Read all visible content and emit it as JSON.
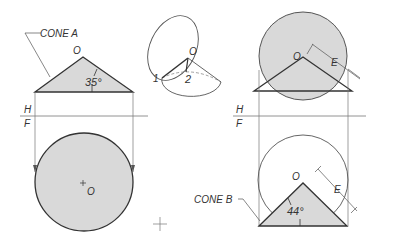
{
  "labels": {
    "cone_a": "CONE A",
    "cone_b": "CONE B",
    "apex_o": "O",
    "angle_a": "35°",
    "angle_b": "44°",
    "h": "H",
    "f": "F",
    "e": "E",
    "point_1": "1",
    "point_2": "2"
  },
  "colors": {
    "stroke": "#333333",
    "fill": "#d9d9d9",
    "thin": "#777777"
  }
}
